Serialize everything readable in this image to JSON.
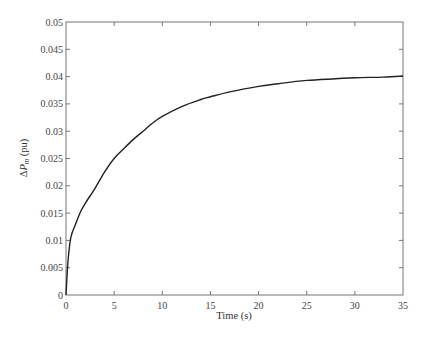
{
  "chart_data": {
    "type": "line",
    "title": "",
    "xlabel": "Time (s)",
    "ylabel": "ΔP_m (pu)",
    "ylabel_parts": {
      "delta": "Δ",
      "symbol": "P",
      "subscript": "m",
      "unit": " (pu)"
    },
    "xlim": [
      0,
      35
    ],
    "ylim": [
      0,
      0.05
    ],
    "grid": false,
    "legend": null,
    "xticks": [
      0,
      5,
      10,
      15,
      20,
      25,
      30,
      35
    ],
    "xtick_labels": [
      "0",
      "5",
      "10",
      "15",
      "20",
      "25",
      "30",
      "35"
    ],
    "yticks": [
      0,
      0.005,
      0.01,
      0.015,
      0.02,
      0.025,
      0.03,
      0.035,
      0.04,
      0.045,
      0.05
    ],
    "ytick_labels": [
      "0",
      "0.005",
      "0.01",
      "0.015",
      "0.02",
      "0.025",
      "0.03",
      "0.035",
      "0.04",
      "0.045",
      "0.05"
    ],
    "series": [
      {
        "name": "ΔP_m",
        "color": "#222222",
        "x": [
          0,
          0.2,
          0.5,
          1,
          1.5,
          2,
          3,
          4,
          5,
          6,
          7,
          8,
          9,
          10,
          12,
          14,
          15,
          17,
          20,
          22,
          25,
          28,
          30,
          33,
          35
        ],
        "y": [
          0,
          0.006,
          0.0105,
          0.013,
          0.0152,
          0.0168,
          0.0195,
          0.0225,
          0.025,
          0.0268,
          0.0285,
          0.03,
          0.0315,
          0.0327,
          0.0345,
          0.0358,
          0.0363,
          0.0372,
          0.0382,
          0.0387,
          0.0393,
          0.0396,
          0.0398,
          0.0399,
          0.0401
        ]
      }
    ]
  }
}
